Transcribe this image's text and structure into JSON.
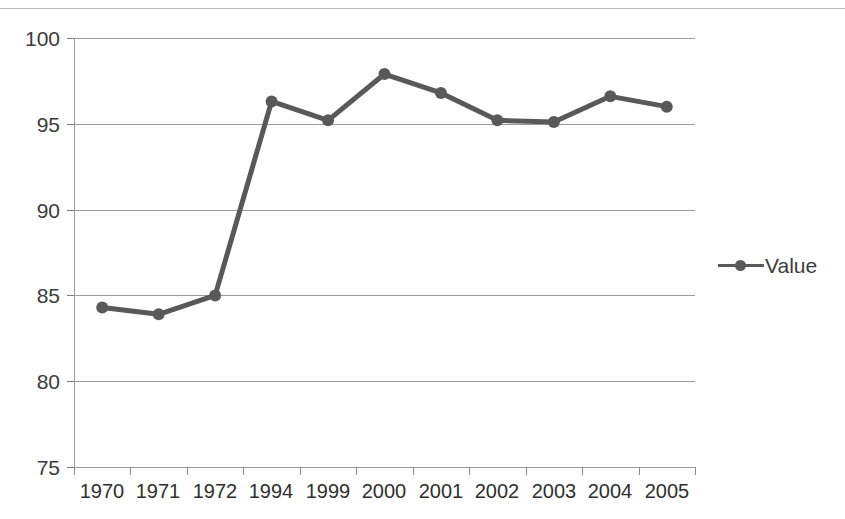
{
  "chart_data": {
    "type": "line",
    "title": "",
    "subtitle": "",
    "xlabel": "",
    "ylabel": "",
    "categories": [
      "1970",
      "1971",
      "1972",
      "1994",
      "1999",
      "2000",
      "2001",
      "2002",
      "2003",
      "2004",
      "2005"
    ],
    "series": [
      {
        "name": "Value",
        "values": [
          84.3,
          83.9,
          85.0,
          96.3,
          95.2,
          97.9,
          96.8,
          95.2,
          95.1,
          96.6,
          96.0
        ],
        "color": "#595959",
        "marker": "circle"
      }
    ],
    "ylim": [
      75,
      100
    ],
    "yticks": [
      75,
      80,
      85,
      90,
      95,
      100
    ],
    "ytick_labels": [
      "75",
      "80",
      "85",
      "90",
      "95",
      "100"
    ],
    "grid": "horizontal",
    "legend": {
      "position": "right",
      "entries": [
        "Value"
      ]
    },
    "annotations": []
  },
  "legend": {
    "value_label": "Value",
    "symbol_name": "line-marker-swatch"
  },
  "axis": {
    "y_labels": [
      "100",
      "95",
      "90",
      "85",
      "80",
      "75"
    ],
    "x_labels": [
      "1970",
      "1971",
      "1972",
      "1994",
      "1999",
      "2000",
      "2001",
      "2002",
      "2003",
      "2004",
      "2005"
    ]
  },
  "colors": {
    "series": "#595959",
    "gridline": "#9c9c9c",
    "axis": "#9c9c9c",
    "text": "#3c3c3c",
    "background": "#ffffff"
  }
}
